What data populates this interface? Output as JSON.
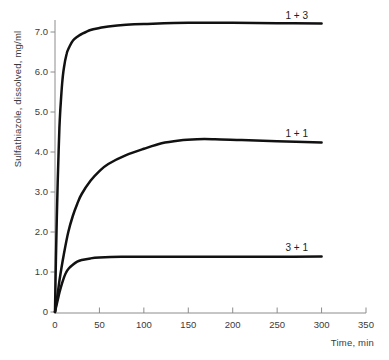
{
  "figure": {
    "background": "#ffffff",
    "curve_color": "#111111",
    "axis_color": "#8c8c8c",
    "tick_text_color": "#3a3a3a",
    "label_text_color": "#222222"
  },
  "chart_data": {
    "type": "line",
    "title": "",
    "xlabel": "Time, min",
    "ylabel": "Sulfathiazole, dissolved, mg/ml",
    "xlim": [
      0,
      350
    ],
    "ylim": [
      0,
      7.3
    ],
    "grid": false,
    "legend": "inline-labels-at-curve-end",
    "x_ticks": [
      0,
      50,
      100,
      150,
      200,
      250,
      300,
      350
    ],
    "x_tick_labels": [
      "0",
      "50",
      "100",
      "150",
      "200",
      "250",
      "300",
      "350"
    ],
    "y_ticks": [
      0,
      1,
      2,
      3,
      4,
      5,
      6,
      7
    ],
    "y_tick_labels": [
      "0",
      "1.0",
      "2.0",
      "3.0",
      "4.0",
      "5.0",
      "6.0",
      "7.0"
    ],
    "series": [
      {
        "name": "1 + 3",
        "plateau": 7.2,
        "points": [
          [
            0,
            0
          ],
          [
            1,
            1.3
          ],
          [
            2,
            2.35
          ],
          [
            3,
            3.25
          ],
          [
            4,
            4.0
          ],
          [
            5,
            4.6
          ],
          [
            6,
            5.05
          ],
          [
            8,
            5.7
          ],
          [
            10,
            6.1
          ],
          [
            13,
            6.45
          ],
          [
            16,
            6.62
          ],
          [
            20,
            6.78
          ],
          [
            25,
            6.88
          ],
          [
            30,
            6.95
          ],
          [
            40,
            7.05
          ],
          [
            50,
            7.1
          ],
          [
            60,
            7.14
          ],
          [
            80,
            7.18
          ],
          [
            100,
            7.2
          ],
          [
            150,
            7.23
          ],
          [
            200,
            7.23
          ],
          [
            250,
            7.22
          ],
          [
            300,
            7.21
          ]
        ]
      },
      {
        "name": "1 + 1",
        "plateau": 4.3,
        "points": [
          [
            0,
            0
          ],
          [
            2,
            0.3
          ],
          [
            5,
            0.78
          ],
          [
            10,
            1.45
          ],
          [
            15,
            2.0
          ],
          [
            20,
            2.4
          ],
          [
            25,
            2.7
          ],
          [
            30,
            2.95
          ],
          [
            40,
            3.28
          ],
          [
            50,
            3.52
          ],
          [
            60,
            3.7
          ],
          [
            80,
            3.92
          ],
          [
            100,
            4.08
          ],
          [
            120,
            4.22
          ],
          [
            140,
            4.29
          ],
          [
            160,
            4.32
          ],
          [
            180,
            4.32
          ],
          [
            210,
            4.3
          ],
          [
            250,
            4.27
          ],
          [
            300,
            4.24
          ]
        ]
      },
      {
        "name": "3 + 1",
        "plateau": 1.4,
        "points": [
          [
            0,
            0
          ],
          [
            2,
            0.2
          ],
          [
            5,
            0.48
          ],
          [
            8,
            0.72
          ],
          [
            12,
            0.97
          ],
          [
            16,
            1.1
          ],
          [
            20,
            1.18
          ],
          [
            25,
            1.26
          ],
          [
            30,
            1.3
          ],
          [
            40,
            1.34
          ],
          [
            50,
            1.36
          ],
          [
            75,
            1.38
          ],
          [
            100,
            1.38
          ],
          [
            150,
            1.38
          ],
          [
            200,
            1.38
          ],
          [
            250,
            1.38
          ],
          [
            300,
            1.39
          ]
        ]
      }
    ]
  }
}
